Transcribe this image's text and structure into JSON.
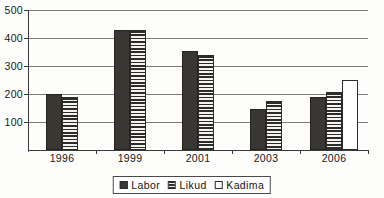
{
  "chart_data": {
    "type": "bar",
    "title": "",
    "subtitle": "",
    "xlabel": "",
    "ylabel": "",
    "categories": [
      "1996",
      "1999",
      "2001",
      "2003",
      "2006"
    ],
    "series": [
      {
        "name": "Labor",
        "values": [
          200,
          428,
          352,
          145,
          190
        ]
      },
      {
        "name": "Likud",
        "values": [
          190,
          430,
          338,
          175,
          205
        ]
      },
      {
        "name": "Kadima",
        "values": [
          null,
          null,
          null,
          null,
          248
        ]
      }
    ],
    "ylim": [
      0,
      500
    ],
    "ytick_labels": [
      "100",
      "200",
      "300",
      "400",
      "500"
    ],
    "ytick_values": [
      100,
      200,
      300,
      400,
      500
    ],
    "grid": true,
    "grid_axis": "y",
    "legend_position": "bottom-center",
    "legend": [
      {
        "label": "Labor",
        "swatch": "solid-dark-square",
        "color": "#3a3733"
      },
      {
        "label": "Likud",
        "swatch": "horizontal-striped-square",
        "color": "#2e2c29"
      },
      {
        "label": "Kadima",
        "swatch": "white-open-square",
        "color": "#ffffff"
      }
    ]
  },
  "colors": {
    "labor": "#3a3733",
    "likud": "#2e2c29",
    "kadima": "#ffffff",
    "axis": "#3a3a3a",
    "gridline": "#7a7a7a",
    "background": "#fdfdfc"
  }
}
